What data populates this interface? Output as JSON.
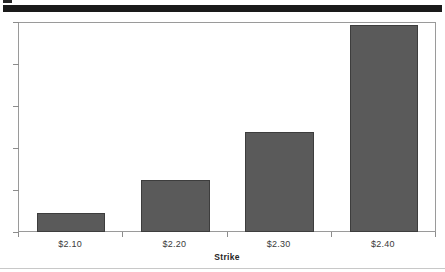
{
  "decorations": {
    "top_nub": "top-corner-mark",
    "top_rule": "header-rule",
    "bottom_rule": "footer-rule"
  },
  "chart_data": {
    "type": "bar",
    "title": "",
    "subtitle": "",
    "xlabel": "Strike",
    "ylabel": "",
    "categories": [
      "$2.10",
      "$2.20",
      "$2.30",
      "$2.40"
    ],
    "values": [
      0.09,
      0.25,
      0.48,
      0.99
    ],
    "values_normalized": [
      0.09,
      0.25,
      0.48,
      0.99
    ],
    "ylim": [
      0,
      1
    ],
    "yticks": [
      0,
      0.2,
      0.4,
      0.6,
      0.8,
      1
    ],
    "ytick_labels": [
      "",
      "",
      "",
      "",
      "",
      ""
    ],
    "grid": false,
    "legend": null,
    "legend_position": "none",
    "bar_color": "#5a5a5a",
    "bar_edge_color": "#3d3d3d",
    "frame_color": "#9a9a9a",
    "background": "#ffffff",
    "annotations": []
  }
}
